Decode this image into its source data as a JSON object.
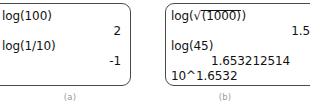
{
  "figure": {
    "panels": [
      {
        "caption": "(a)",
        "lines": [
          {
            "kind": "input",
            "text": "log(100)"
          },
          {
            "kind": "result",
            "text": "2"
          },
          {
            "kind": "input",
            "text": "log(1/10)"
          },
          {
            "kind": "result",
            "text": "-1"
          }
        ]
      },
      {
        "caption": "(b)",
        "lines": [
          {
            "kind": "input_sqrt",
            "prefix": "log(",
            "radicand": "(1000)",
            "suffix": ")"
          },
          {
            "kind": "result",
            "text": "1.5"
          },
          {
            "kind": "input",
            "text": "log(45)"
          },
          {
            "kind": "result",
            "text": "1.653212514"
          },
          {
            "kind": "input",
            "text": "10^1.6532"
          },
          {
            "kind": "result",
            "text": "44.99870339"
          }
        ]
      }
    ]
  },
  "panel_a": {
    "line1_input": "log(100)",
    "line1_result": "2",
    "line2_input": "log(1/10)",
    "line2_result": "-1",
    "caption": "(a)"
  },
  "panel_b": {
    "line1_prefix": "log(",
    "line1_radical": "√",
    "line1_radicand": "(1000)",
    "line1_suffix": ")",
    "line1_result": "1.5",
    "line2_input": "log(45)",
    "line2_result": "1.653212514",
    "line3_input": "10^1.6532",
    "line3_result": "44.99870339",
    "caption": "(b)"
  },
  "colors": {
    "screen_border": "#4a4a4a",
    "screen_background": "#ffffff",
    "text": "#121212",
    "caption": "#9a9a9a",
    "page_background": "#ffffff"
  }
}
